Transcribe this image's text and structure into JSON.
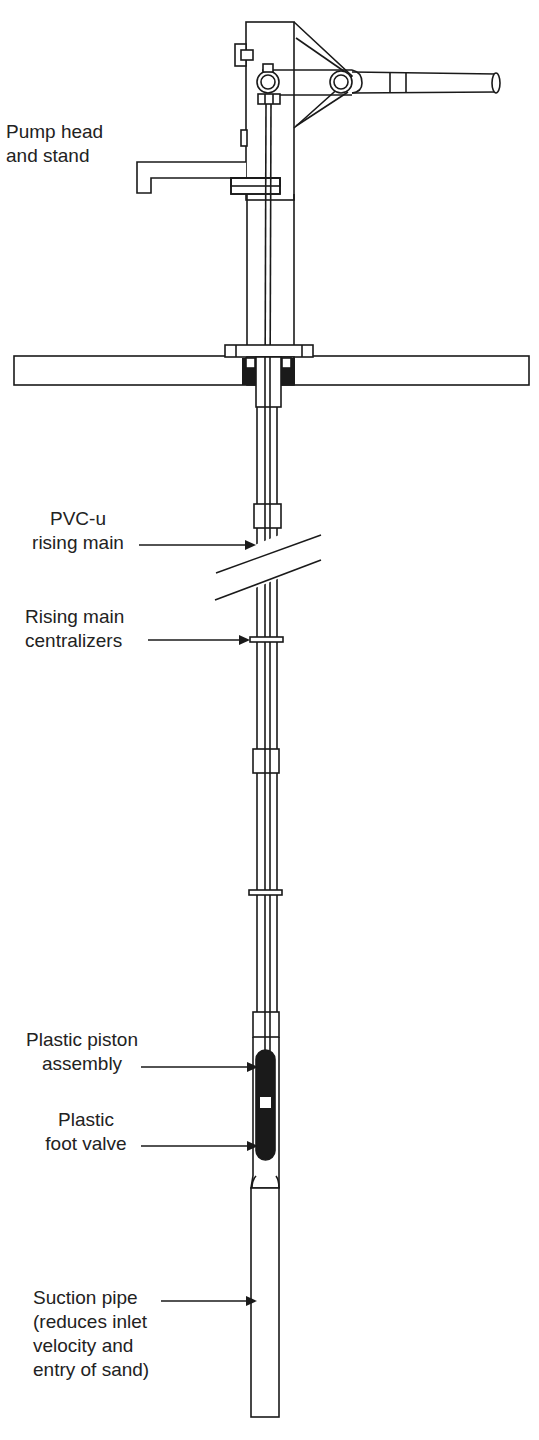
{
  "figure": {
    "colors": {
      "line": "#1a1a1a",
      "fill_dark": "#1a1a1a",
      "background": "#ffffff",
      "text": "#222222"
    }
  },
  "labels": {
    "pump_head": "Pump head\nand stand",
    "rising_main": "PVC-u\nrising main",
    "centralizers": "Rising main\ncentralizers",
    "piston": "Plastic piston\nassembly",
    "foot_valve": "Plastic\nfoot valve",
    "suction_pipe": "Suction pipe\n(reduces inlet\nvelocity and\nentry of sand)"
  }
}
